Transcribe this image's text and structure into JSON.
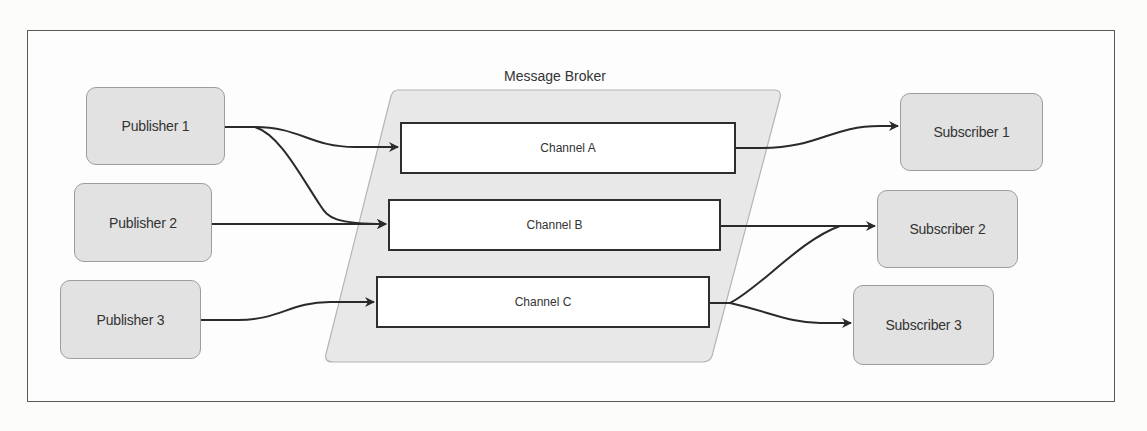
{
  "diagram": {
    "broker": {
      "label": "Message Broker"
    },
    "channels": [
      {
        "id": "A",
        "label": "Channel A"
      },
      {
        "id": "B",
        "label": "Channel B"
      },
      {
        "id": "C",
        "label": "Channel C"
      }
    ],
    "publishers": [
      {
        "label": "Publisher 1"
      },
      {
        "label": "Publisher 2"
      },
      {
        "label": "Publisher 3"
      }
    ],
    "subscribers": [
      {
        "label": "Subscriber 1"
      },
      {
        "label": "Subscriber 2"
      },
      {
        "label": "Subscriber 3"
      }
    ],
    "edges": [
      {
        "from": "Publisher 1",
        "to": "Channel A"
      },
      {
        "from": "Publisher 1",
        "to": "Channel B"
      },
      {
        "from": "Publisher 2",
        "to": "Channel B"
      },
      {
        "from": "Publisher 3",
        "to": "Channel C"
      },
      {
        "from": "Channel A",
        "to": "Subscriber 1"
      },
      {
        "from": "Channel B",
        "to": "Subscriber 2"
      },
      {
        "from": "Channel C",
        "to": "Subscriber 2"
      },
      {
        "from": "Channel C",
        "to": "Subscriber 3"
      }
    ],
    "colors": {
      "node_fill": "#e2e2e2",
      "node_border": "#9d9d9d",
      "broker_fill": "#e8e8e8",
      "channel_fill": "#ffffff",
      "channel_border": "#2e2e2e",
      "edge": "#2a2a2a"
    }
  }
}
